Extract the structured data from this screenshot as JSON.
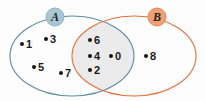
{
  "figure": {
    "name": "venn-diagram",
    "width": 205,
    "height": 101,
    "background_color": "#fdfdfd"
  },
  "sets": [
    {
      "id": "A",
      "label": "A",
      "stroke_color": "#5b8ca5",
      "badge_fill": "#a9c6d4",
      "badge_x": 55,
      "badge_y": 17,
      "cx": 72,
      "cy": 56,
      "rx": 62,
      "ry": 40
    },
    {
      "id": "B",
      "label": "B",
      "stroke_color": "#e2703a",
      "badge_fill": "#f0a074",
      "badge_x": 157,
      "badge_y": 17,
      "cx": 134,
      "cy": 56,
      "rx": 62,
      "ry": 40
    }
  ],
  "intersection": {
    "fill_color": "#ebebeb",
    "region_label": "A-intersect-B"
  },
  "elements": [
    {
      "value": "1",
      "region": "A-only",
      "dot_x": 22,
      "dot_y": 44,
      "label_x": 26,
      "label_y": 44
    },
    {
      "value": "3",
      "region": "A-only",
      "dot_x": 46,
      "dot_y": 39,
      "label_x": 50,
      "label_y": 39
    },
    {
      "value": "5",
      "region": "A-only",
      "dot_x": 34,
      "dot_y": 67,
      "label_x": 38,
      "label_y": 67
    },
    {
      "value": "7",
      "region": "A-only",
      "dot_x": 61,
      "dot_y": 73,
      "label_x": 65,
      "label_y": 73
    },
    {
      "value": "6",
      "region": "A-and-B",
      "dot_x": 90,
      "dot_y": 40,
      "label_x": 94,
      "label_y": 40
    },
    {
      "value": "4",
      "region": "A-and-B",
      "dot_x": 90,
      "dot_y": 56,
      "label_x": 94,
      "label_y": 56
    },
    {
      "value": "0",
      "region": "A-and-B",
      "dot_x": 111,
      "dot_y": 56,
      "label_x": 115,
      "label_y": 56
    },
    {
      "value": "2",
      "region": "A-and-B",
      "dot_x": 90,
      "dot_y": 70,
      "label_x": 94,
      "label_y": 70
    },
    {
      "value": "8",
      "region": "B-only",
      "dot_x": 146,
      "dot_y": 56,
      "label_x": 150,
      "label_y": 56
    }
  ]
}
